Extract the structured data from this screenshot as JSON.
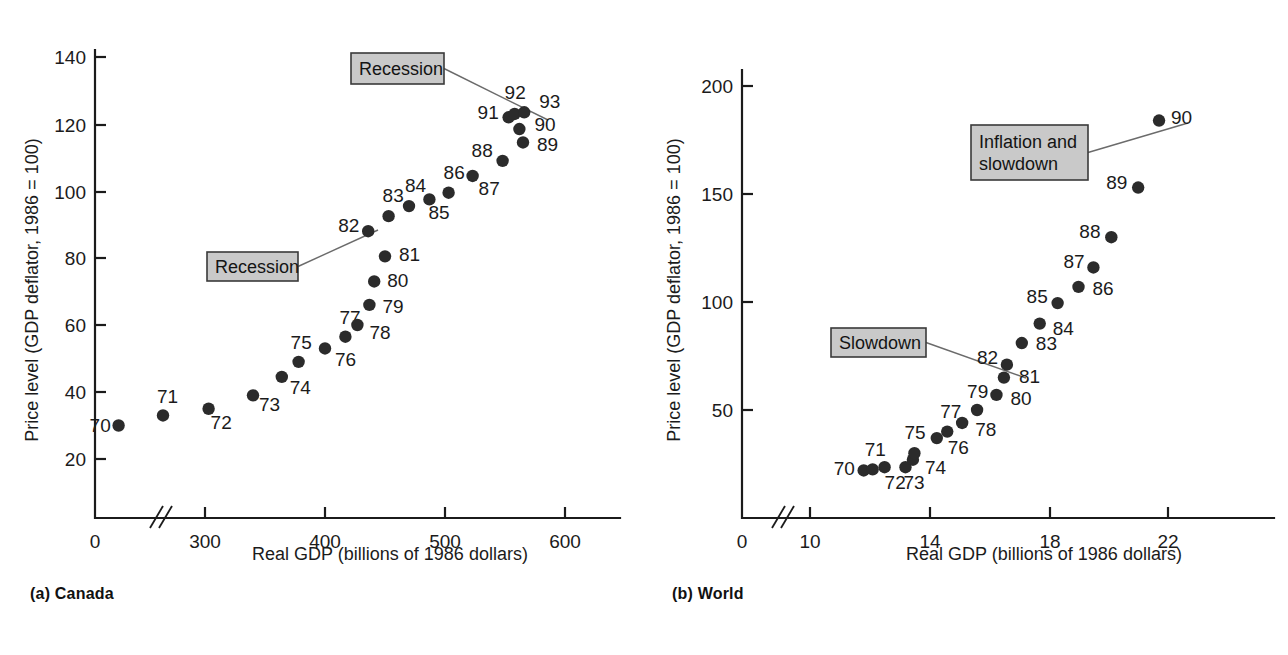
{
  "figure": {
    "background": "#ffffff",
    "dot_color": "#2b2b2b",
    "callout_fill": "#c9c9c9",
    "callout_border": "#3a3a3a",
    "axis_color": "#1b1b1b"
  },
  "panels": [
    {
      "id": "canada",
      "caption": "(a) Canada"
    },
    {
      "id": "world",
      "caption": "(b) World"
    }
  ],
  "chart_data": [
    {
      "type": "scatter",
      "title": "(a) Canada",
      "xlabel": "Real GDP (billions of 1986 dollars)",
      "ylabel": "Price level (GDP deflator, 1986 = 100)",
      "xlim": [
        220,
        600
      ],
      "ylim": [
        0,
        145
      ],
      "xticks": [
        0,
        300,
        400,
        500,
        600
      ],
      "xticklabels": [
        "0",
        "300",
        "400",
        "500",
        "600"
      ],
      "yticks": [
        20,
        40,
        60,
        80,
        100,
        120,
        140
      ],
      "yticklabels": [
        "20",
        "40",
        "60",
        "80",
        "100",
        "120",
        "140"
      ],
      "axis_break": true,
      "grid": false,
      "legend": "none",
      "point_labels": [
        "70",
        "71",
        "72",
        "73",
        "74",
        "75",
        "76",
        "77",
        "78",
        "79",
        "80",
        "81",
        "82",
        "83",
        "84",
        "85",
        "86",
        "87",
        "88",
        "89",
        "90",
        "91",
        "92",
        "93"
      ],
      "x": [
        228,
        265,
        303,
        340,
        364,
        378,
        400,
        417,
        427,
        437,
        441,
        450,
        436,
        453,
        470,
        487,
        503,
        523,
        548,
        565,
        562,
        553,
        558,
        566
      ],
      "y": [
        30,
        33,
        35,
        39,
        44.5,
        49,
        53,
        56.5,
        60,
        66,
        73,
        80.5,
        88,
        92.5,
        95.5,
        97.5,
        99.5,
        104.5,
        109,
        114.5,
        118.5,
        122,
        123,
        123.5
      ],
      "annotations": [
        {
          "text": "Recession",
          "lines": [
            "Recession"
          ],
          "points_to_label": "82",
          "box": {
            "x": 207,
            "y": 252,
            "w": 91,
            "h": 29
          },
          "leader_to": {
            "x": 378,
            "y": 230
          }
        },
        {
          "text": "Recession",
          "lines": [
            "Recession"
          ],
          "points_to_label": "91",
          "box": {
            "x": 351,
            "y": 53,
            "w": 93,
            "h": 31
          },
          "leader_to": {
            "x": 548,
            "y": 120
          }
        }
      ]
    },
    {
      "type": "scatter",
      "title": "(b) World",
      "xlabel": "Real GDP (billions of 1986 dollars)",
      "ylabel": "Price level (GDP deflator, 1986 = 100)",
      "xlim": [
        10,
        22.6
      ],
      "ylim": [
        0,
        210
      ],
      "xticks": [
        0,
        10,
        14,
        18,
        22
      ],
      "xticklabels": [
        "0",
        "10",
        "14",
        "18",
        "22"
      ],
      "yticks": [
        50,
        100,
        150,
        200
      ],
      "yticklabels": [
        "50",
        "100",
        "150",
        "200"
      ],
      "axis_break": true,
      "grid": false,
      "legend": "none",
      "point_labels": [
        "70",
        "71",
        "72",
        "73",
        "74",
        "75",
        "76",
        "77",
        "78",
        "79",
        "80",
        "81",
        "82",
        "83",
        "84",
        "85",
        "86",
        "87",
        "88",
        "89",
        "90"
      ],
      "x": [
        11.8,
        12.1,
        12.5,
        13.2,
        13.45,
        13.5,
        14.25,
        14.6,
        15.1,
        15.6,
        16.25,
        16.5,
        16.6,
        17.1,
        17.7,
        18.3,
        19.0,
        19.5,
        20.1,
        21.0,
        21.7
      ],
      "y": [
        22,
        22.5,
        23.5,
        23.5,
        27,
        30,
        37,
        40,
        44,
        50,
        57,
        65,
        71,
        81,
        90,
        99.5,
        107,
        116,
        130,
        153,
        184
      ],
      "annotations": [
        {
          "text": "Slowdown",
          "lines": [
            "Slowdown"
          ],
          "points_to_label": "81",
          "box": {
            "x": 831,
            "y": 328,
            "w": 95,
            "h": 29
          },
          "leader_to": {
            "x": 1026,
            "y": 378
          }
        },
        {
          "text": "Inflation and slowdown",
          "lines": [
            "Inflation and",
            "slowdown"
          ],
          "points_to_label": "90",
          "box": {
            "x": 971,
            "y": 125,
            "w": 117,
            "h": 55
          },
          "leader_to": {
            "x": 1188,
            "y": 123
          }
        }
      ]
    }
  ]
}
